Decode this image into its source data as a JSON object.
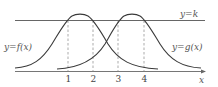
{
  "figure": {
    "type": "function-graph",
    "labels": {
      "horizontal_line": "y=k",
      "f_curve": "y=f(x)",
      "g_curve": "y=g(x)",
      "x_axis": "x"
    },
    "ticks": [
      "1",
      "2",
      "3",
      "4"
    ],
    "colors": {
      "curve": "#3a3a3a",
      "line": "#555555",
      "dashed": "#888888",
      "background": "#ffffff"
    }
  }
}
